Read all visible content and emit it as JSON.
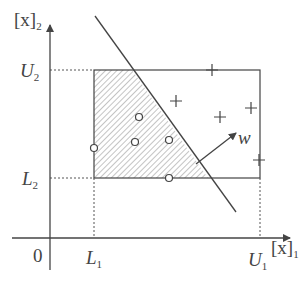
{
  "diagram": {
    "colors": {
      "stroke": "#444444",
      "hatch": "#888888",
      "background": "#ffffff"
    },
    "axes": {
      "origin_label": "0",
      "x_label": "[x]",
      "x_label_sub": "1",
      "y_label": "[x]",
      "y_label_sub": "2"
    },
    "box": {
      "L1": "L",
      "L1_sub": "1",
      "U1": "U",
      "U1_sub": "1",
      "L2": "L",
      "L2_sub": "2",
      "U2": "U",
      "U2_sub": "2"
    },
    "normal_vector_label": "w",
    "circle_points": [
      {
        "x": 94,
        "y": 148
      },
      {
        "x": 139,
        "y": 117
      },
      {
        "x": 135,
        "y": 142
      },
      {
        "x": 169,
        "y": 140
      },
      {
        "x": 169,
        "y": 178
      }
    ],
    "plus_points": [
      {
        "x": 212,
        "y": 70
      },
      {
        "x": 176,
        "y": 101
      },
      {
        "x": 220,
        "y": 117
      },
      {
        "x": 251,
        "y": 108
      },
      {
        "x": 259,
        "y": 160
      }
    ]
  }
}
